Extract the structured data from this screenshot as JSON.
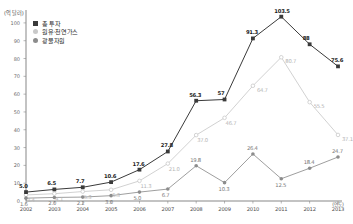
{
  "chart_data": {
    "type": "line",
    "title": "",
    "unit_label": "(억 달러)",
    "xlabel": "(연도)",
    "ylabel": "",
    "ylim": [
      0,
      105
    ],
    "yticks": [
      0,
      10,
      20,
      30,
      40,
      50,
      60,
      70,
      80,
      90,
      100
    ],
    "grid": false,
    "legend_position": "top-left",
    "categories": [
      "2002",
      "2003",
      "2004",
      "2005",
      "2006",
      "2007",
      "2008",
      "2009",
      "2010",
      "2011",
      "2012",
      "2013"
    ],
    "series": [
      {
        "name": "총 투자",
        "marker": "square",
        "color": "#3a3a3a",
        "values": [
          5.0,
          6.5,
          7.7,
          10.6,
          17.6,
          27.8,
          56.3,
          57.0,
          91.3,
          103.5,
          88.0,
          75.6
        ],
        "labels": [
          "5.0",
          "6.5",
          "7.7",
          "10.6",
          "17.6",
          "27.8",
          "56.3",
          "57",
          "91.3",
          "103.5",
          "88",
          "75.6"
        ]
      },
      {
        "name": "원유·천연가스",
        "marker": "circle-open",
        "color": "#c9c9c9",
        "values": [
          3.4,
          4.1,
          5.3,
          6.3,
          11.3,
          21.0,
          37.0,
          46.7,
          64.7,
          80.7,
          55.5,
          37.1
        ],
        "labels": [
          "3.4",
          "4.1",
          "5.3",
          "6.3",
          "11.3",
          "21.0",
          "37.0",
          "46.7",
          "64.7",
          "80.7",
          "55.5",
          "37.1"
        ]
      },
      {
        "name": "광물자원",
        "marker": "circle-fill",
        "color": "#8c8c8c",
        "values": [
          1.6,
          2.0,
          2.2,
          3.0,
          5.0,
          6.7,
          19.8,
          10.3,
          26.4,
          12.5,
          18.4,
          24.7
        ],
        "labels": [
          "1.6",
          "2.0",
          "2.2",
          "3.0",
          "5.0",
          "6.7",
          "19.8",
          "10.3",
          "26.4",
          "12.5",
          "18.4",
          "24.7"
        ]
      }
    ]
  }
}
